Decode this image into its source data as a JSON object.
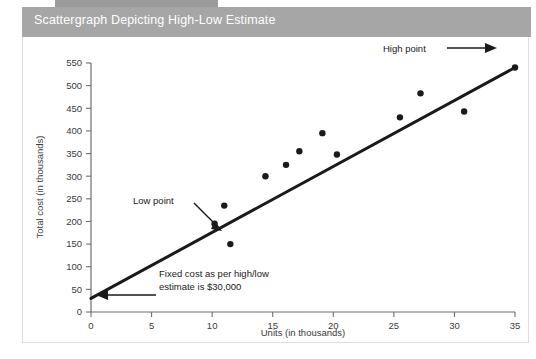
{
  "header": {
    "title": "Scattergraph Depicting High-Low Estimate",
    "band_color": "#a6a6a6",
    "strip_color": "#9b9b9b",
    "title_color": "#ffffff"
  },
  "panel": {
    "background": "#ffffff",
    "border_color": "#dedede"
  },
  "chart_data": {
    "type": "scatter",
    "title": "Scattergraph Depicting High-Low Estimate",
    "xlabel": "Units (in thousands)",
    "ylabel": "Total cost (in thousands)",
    "xlim": [
      0,
      35
    ],
    "ylim": [
      0,
      550
    ],
    "xticks": [
      0,
      5,
      10,
      15,
      20,
      25,
      30,
      35
    ],
    "yticks": [
      0,
      50,
      100,
      150,
      200,
      250,
      300,
      350,
      400,
      450,
      500,
      550
    ],
    "xtick_labels": [
      "0",
      "5",
      "10",
      "15",
      "20",
      "25",
      "30",
      "35"
    ],
    "ytick_labels": [
      "0",
      "50",
      "100",
      "150",
      "200",
      "250",
      "300",
      "350",
      "400",
      "450",
      "500",
      "550"
    ],
    "grid": false,
    "legend": "none",
    "point_color": "#1a1a1a",
    "line_color": "#1a1a1a",
    "series": [
      {
        "name": "Observed cost points",
        "points": [
          {
            "x": 10.2,
            "y": 195,
            "label": "Low point"
          },
          {
            "x": 11.0,
            "y": 235,
            "label": ""
          },
          {
            "x": 11.5,
            "y": 150,
            "label": ""
          },
          {
            "x": 14.4,
            "y": 300,
            "label": ""
          },
          {
            "x": 16.1,
            "y": 325,
            "label": ""
          },
          {
            "x": 17.2,
            "y": 355,
            "label": ""
          },
          {
            "x": 19.1,
            "y": 395,
            "label": ""
          },
          {
            "x": 20.3,
            "y": 348,
            "label": ""
          },
          {
            "x": 25.5,
            "y": 430,
            "label": ""
          },
          {
            "x": 27.2,
            "y": 483,
            "label": ""
          },
          {
            "x": 30.8,
            "y": 443,
            "label": ""
          },
          {
            "x": 35.0,
            "y": 540,
            "label": "High point"
          }
        ]
      }
    ],
    "trend_line": {
      "name": "High-low estimate line",
      "x_start": 0,
      "y_start": 30,
      "x_end": 35,
      "y_end": 540,
      "intercept": 30,
      "slope": 14.57
    },
    "annotations": [
      {
        "id": "low-point",
        "text": "Low point",
        "target_x": 10.2,
        "target_y": 195,
        "arrow": "down-right"
      },
      {
        "id": "high-point",
        "text": "High point",
        "target_x": 35.0,
        "target_y": 540,
        "arrow": "right"
      },
      {
        "id": "fixed-cost",
        "text_line_1": "Fixed cost as per high/low",
        "text_line_2": "estimate is $30,000",
        "target_x": 0,
        "target_y": 30,
        "arrow": "left"
      }
    ]
  }
}
